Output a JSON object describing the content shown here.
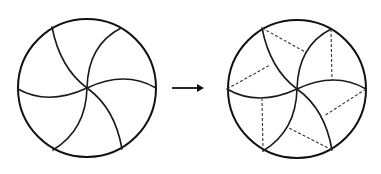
{
  "diagram": {
    "description": "Pinwheel circle divided by six curved arcs, transformed into the same figure with dashed chords added",
    "colors": {
      "stroke": "#1a1a1a",
      "dashed": "#333333",
      "background": "#ffffff"
    },
    "left_figure": {
      "label": "circle with six curved spokes",
      "center": [
        87,
        88
      ],
      "radius": 69,
      "spokes": [
        {
          "from": [
            87,
            88
          ],
          "to": [
            52,
            27
          ],
          "ctrl": [
            60,
            68
          ]
        },
        {
          "from": [
            87,
            88
          ],
          "to": [
            121,
            28
          ],
          "ctrl": [
            88,
            45
          ]
        },
        {
          "from": [
            87,
            88
          ],
          "to": [
            156,
            88
          ],
          "ctrl": [
            125,
            70
          ]
        },
        {
          "from": [
            87,
            88
          ],
          "to": [
            122,
            149
          ],
          "ctrl": [
            115,
            108
          ]
        },
        {
          "from": [
            87,
            88
          ],
          "to": [
            53,
            150
          ],
          "ctrl": [
            86,
            130
          ]
        },
        {
          "from": [
            87,
            88
          ],
          "to": [
            18,
            89
          ],
          "ctrl": [
            48,
            106
          ]
        }
      ]
    },
    "arrow": {
      "from": [
        172,
        88
      ],
      "to": [
        204,
        88
      ],
      "icon": "right-arrow"
    },
    "right_figure": {
      "label": "circle with six curved spokes and dashed construction lines",
      "center": [
        297,
        89
      ],
      "radius": 69,
      "spokes": [
        {
          "from": [
            297,
            89
          ],
          "to": [
            262,
            28
          ],
          "ctrl": [
            270,
            69
          ]
        },
        {
          "from": [
            297,
            89
          ],
          "to": [
            331,
            29
          ],
          "ctrl": [
            298,
            46
          ]
        },
        {
          "from": [
            297,
            89
          ],
          "to": [
            366,
            89
          ],
          "ctrl": [
            335,
            71
          ]
        },
        {
          "from": [
            297,
            89
          ],
          "to": [
            332,
            150
          ],
          "ctrl": [
            325,
            109
          ]
        },
        {
          "from": [
            297,
            89
          ],
          "to": [
            263,
            151
          ],
          "ctrl": [
            296,
            131
          ]
        },
        {
          "from": [
            297,
            89
          ],
          "to": [
            227,
            89
          ],
          "ctrl": [
            258,
            107
          ]
        }
      ],
      "dashed_lines": [
        {
          "from": [
            262,
            28
          ],
          "to": [
            307,
            53
          ]
        },
        {
          "from": [
            331,
            29
          ],
          "to": [
            332,
            81
          ]
        },
        {
          "from": [
            366,
            89
          ],
          "to": [
            324,
            116
          ]
        },
        {
          "from": [
            332,
            150
          ],
          "to": [
            287,
            127
          ]
        },
        {
          "from": [
            263,
            151
          ],
          "to": [
            262,
            99
          ]
        },
        {
          "from": [
            227,
            89
          ],
          "to": [
            270,
            65
          ]
        }
      ]
    }
  }
}
